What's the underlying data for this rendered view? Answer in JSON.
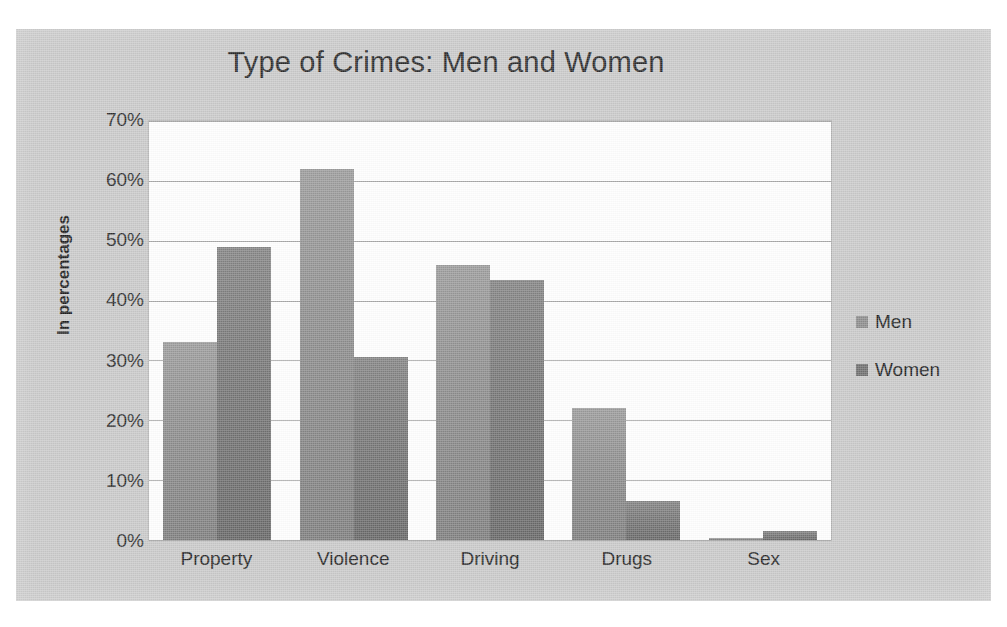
{
  "chart_data": {
    "type": "bar",
    "title": "Type of Crimes: Men and Women",
    "xlabel": "",
    "ylabel": "In percentages",
    "categories": [
      "Property",
      "Violence",
      "Driving",
      "Drugs",
      "Sex"
    ],
    "series": [
      {
        "name": "Men",
        "values": [
          33,
          62,
          46,
          22,
          0.3
        ]
      },
      {
        "name": "Women",
        "values": [
          49,
          30.5,
          43.5,
          6.5,
          1.5
        ]
      }
    ],
    "ylim": [
      0,
      70
    ],
    "ytick_labels": [
      "70%",
      "60%",
      "50%",
      "40%",
      "30%",
      "20%",
      "10%",
      "0%"
    ],
    "ytick_values": [
      70,
      60,
      50,
      40,
      30,
      20,
      10,
      0
    ],
    "grid": true,
    "legend_position": "right",
    "colors": {
      "men": "#8c8c8c",
      "women": "#6f6f6f",
      "panel": "#c9c9c9",
      "plot": "#fefefe",
      "gridline": "#a8a8a8"
    }
  },
  "legend": {
    "items": [
      {
        "label": "Men"
      },
      {
        "label": "Women"
      }
    ]
  }
}
